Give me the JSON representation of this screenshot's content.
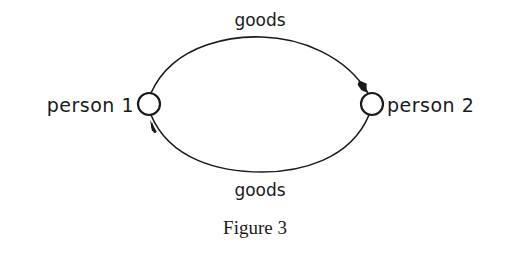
{
  "diagram": {
    "nodes": [
      {
        "id": "person1",
        "label": "person 1"
      },
      {
        "id": "person2",
        "label": "person 2"
      }
    ],
    "edges": [
      {
        "from": "person1",
        "to": "person2",
        "label": "goods",
        "path": "top"
      },
      {
        "from": "person2",
        "to": "person1",
        "label": "goods",
        "path": "bottom"
      }
    ],
    "caption": "Figure 3"
  },
  "colors": {
    "ink": "#1a1a1a",
    "background": "#ffffff"
  }
}
